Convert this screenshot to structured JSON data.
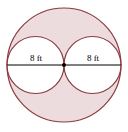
{
  "diagram": {
    "type": "geometry-figure",
    "labels": {
      "left_radius": "8 ft",
      "right_radius": "8 ft"
    },
    "colors": {
      "stroke": "#8b3a3f",
      "shade": "#ecdcdd",
      "line": "#000000",
      "inner_fill": "#ffffff"
    },
    "outer_circle": {
      "cx": 64,
      "cy": 65,
      "r": 57
    },
    "inner_circles": [
      {
        "cx": 35.5,
        "cy": 65,
        "r": 28.5
      },
      {
        "cx": 92.5,
        "cy": 65,
        "r": 28.5
      }
    ],
    "center_point": {
      "cx": 64,
      "cy": 65
    }
  }
}
